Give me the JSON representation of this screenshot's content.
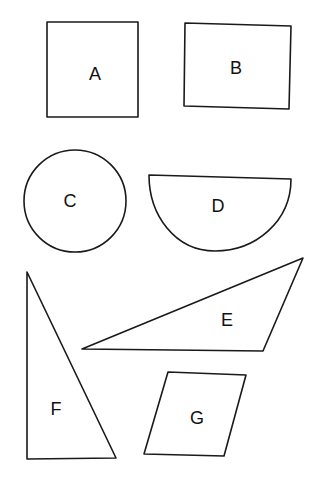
{
  "shapes": [
    {
      "id": "A",
      "label": "A",
      "type": "square"
    },
    {
      "id": "B",
      "label": "B",
      "type": "rectangle"
    },
    {
      "id": "C",
      "label": "C",
      "type": "circle"
    },
    {
      "id": "D",
      "label": "D",
      "type": "semicircle"
    },
    {
      "id": "E",
      "label": "E",
      "type": "obtuse-triangle"
    },
    {
      "id": "F",
      "label": "F",
      "type": "right-triangle"
    },
    {
      "id": "G",
      "label": "G",
      "type": "parallelogram"
    }
  ],
  "colors": {
    "stroke": "#1a1a1a",
    "background": "#ffffff"
  }
}
